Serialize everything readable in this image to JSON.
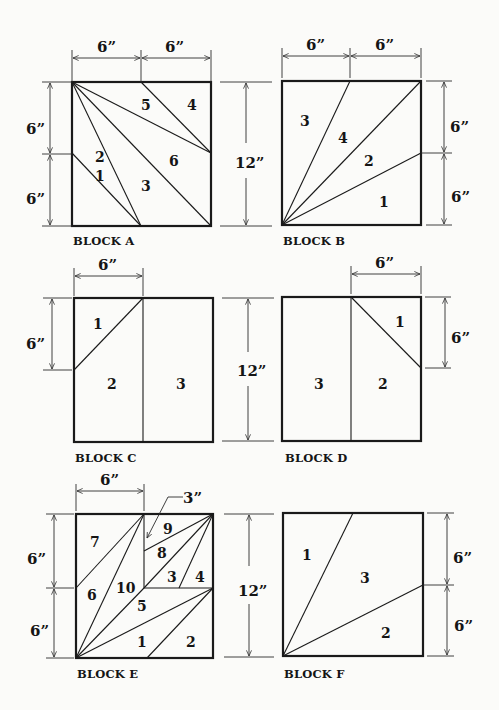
{
  "blocks": {
    "a": {
      "title": "BLOCK A",
      "pieces": [
        "1",
        "2",
        "3",
        "4",
        "5",
        "6"
      ]
    },
    "b": {
      "title": "BLOCK B",
      "pieces": [
        "1",
        "2",
        "3",
        "4"
      ]
    },
    "c": {
      "title": "BLOCK C",
      "pieces": [
        "1",
        "2",
        "3"
      ]
    },
    "d": {
      "title": "BLOCK D",
      "pieces": [
        "1",
        "2",
        "3"
      ]
    },
    "e": {
      "title": "BLOCK E",
      "pieces": [
        "1",
        "2",
        "3",
        "4",
        "5",
        "6",
        "7",
        "8",
        "9",
        "10"
      ],
      "callout": "3”"
    },
    "f": {
      "title": "BLOCK F",
      "pieces": [
        "1",
        "2",
        "3"
      ]
    }
  },
  "dimensions": {
    "half": "6”",
    "full": "12”",
    "quarter": "3”"
  },
  "colors": {
    "line": "#1a1a1a",
    "background": "#fbfbf9"
  }
}
